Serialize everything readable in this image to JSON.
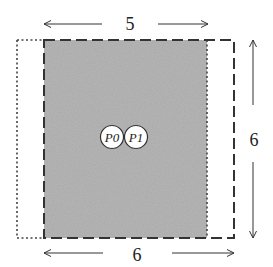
{
  "diagram": {
    "top_dimension": {
      "label": "5"
    },
    "bottom_dimension": {
      "label": "6"
    },
    "right_dimension": {
      "label": "6"
    },
    "nodes": [
      {
        "id": "P0",
        "label": "P0"
      },
      {
        "id": "P1",
        "label": "P1"
      }
    ],
    "colors": {
      "shaded_region": "#a9a9a9",
      "stroke": "#333333",
      "background": "#ffffff"
    }
  }
}
